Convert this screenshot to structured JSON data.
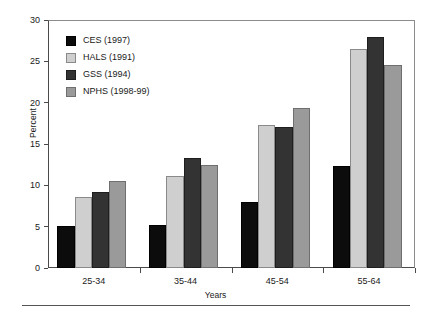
{
  "chart_data": {
    "type": "bar",
    "title": "",
    "xlabel": "Years",
    "ylabel": "Percent",
    "categories": [
      "25-34",
      "35-44",
      "45-54",
      "55-64"
    ],
    "series": [
      {
        "name": "CES (1997)",
        "color": "#0c0c0c",
        "values": [
          5.1,
          5.2,
          8.0,
          12.3
        ]
      },
      {
        "name": "HALS (1991)",
        "color": "#cfcfcf",
        "values": [
          8.6,
          11.1,
          17.3,
          26.5
        ]
      },
      {
        "name": "GSS (1994)",
        "color": "#333333",
        "values": [
          9.2,
          13.3,
          17.0,
          28.0
        ]
      },
      {
        "name": "NPHS (1998-99)",
        "color": "#9a9a9a",
        "values": [
          10.5,
          12.4,
          19.3,
          24.5
        ]
      }
    ],
    "ylim": [
      0,
      30
    ],
    "yticks": [
      0,
      5,
      10,
      15,
      20,
      25,
      30
    ],
    "ytick_labels": [
      "0",
      "5",
      "10",
      "15",
      "20",
      "25",
      "30"
    ],
    "grid": false,
    "legend_position": "top-left"
  }
}
